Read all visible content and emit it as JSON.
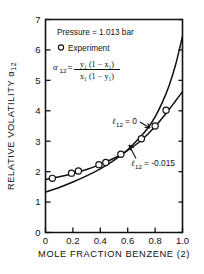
{
  "chart_data": {
    "type": "scatter",
    "title": "",
    "xlabel": "MOLE FRACTION BENZENE (2)",
    "ylabel": "RELATIVE VOLATILITY α₁₂",
    "xlim": [
      0,
      1.0
    ],
    "ylim": [
      0,
      7
    ],
    "xticks": [
      "0",
      "0.2",
      "0.4",
      "0.6",
      "0.8",
      "1.0"
    ],
    "xtick_values": [
      0,
      0.2,
      0.4,
      0.6,
      0.8,
      1.0
    ],
    "yticks": [
      "0",
      "1",
      "2",
      "3",
      "4",
      "5",
      "6",
      "7"
    ],
    "ytick_values": [
      0,
      1,
      2,
      3,
      4,
      5,
      6,
      7
    ],
    "grid": false,
    "legend_position": "inside-upper-left",
    "annotations": {
      "pressure": "Pressure = 1.013 bar",
      "legend_marker_label": "Experiment",
      "formula_lhs": "α",
      "formula_lhs_sub": "12",
      "formula_eq": "=",
      "formula_numerator": "y₁ (1 − x₁)",
      "formula_denominator": "x₁ (1 − y₁)",
      "curve1_label": "ℓ",
      "curve1_sub": "12",
      "curve1_value": "= 0",
      "curve2_label": "ℓ",
      "curve2_sub": "12",
      "curve2_value": "= -0.015"
    },
    "series": [
      {
        "name": "Experiment",
        "marker": "open-circle",
        "x": [
          0.05,
          0.19,
          0.24,
          0.39,
          0.44,
          0.55,
          0.7,
          0.8,
          0.88
        ],
        "y": [
          1.78,
          1.95,
          2.02,
          2.23,
          2.3,
          2.57,
          3.08,
          3.5,
          4.02
        ]
      },
      {
        "name": "l12 = 0",
        "type": "line",
        "x": [
          0.0,
          0.1,
          0.2,
          0.3,
          0.4,
          0.5,
          0.55,
          0.6,
          0.7,
          0.75,
          0.8,
          0.85,
          0.9,
          0.95,
          1.0
        ],
        "y": [
          1.33,
          1.48,
          1.66,
          1.86,
          2.09,
          2.37,
          2.54,
          2.72,
          3.18,
          3.45,
          3.8,
          4.25,
          4.8,
          5.52,
          6.45
        ]
      },
      {
        "name": "l12 = -0.015",
        "type": "line",
        "x": [
          0.0,
          0.05,
          0.1,
          0.2,
          0.3,
          0.4,
          0.5,
          0.55,
          0.6,
          0.7,
          0.8,
          0.9,
          0.95,
          1.0
        ],
        "y": [
          1.74,
          1.78,
          1.83,
          1.94,
          2.07,
          2.24,
          2.44,
          2.56,
          2.7,
          3.03,
          3.48,
          4.03,
          4.33,
          4.63
        ]
      }
    ]
  }
}
